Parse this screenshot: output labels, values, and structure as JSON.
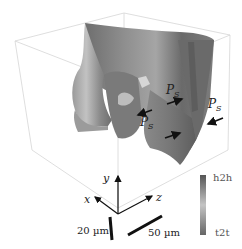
{
  "figure": {
    "type": "3D rendered domain wall surface",
    "annotations": {
      "polarization_label": "P",
      "polarization_sub": "S",
      "polarization_instances": 3
    },
    "axes": {
      "x": "x",
      "y": "y",
      "z": "z"
    },
    "scale_bars": [
      {
        "label": "20 µm",
        "orientation": "vertical"
      },
      {
        "label": "50 µm",
        "orientation": "diagonal"
      }
    ],
    "colorbar": {
      "top_label": "h2h",
      "bottom_label": "t2t",
      "colors": [
        "#5a5a5a",
        "#bdbdbd",
        "#6a6a6a"
      ]
    },
    "colors": {
      "box_edge": "#d0d0d0",
      "surface_dark": "#555555",
      "surface_mid": "#8c8c8c",
      "surface_light": "#c8c8c8",
      "arrow": "#111111"
    }
  }
}
